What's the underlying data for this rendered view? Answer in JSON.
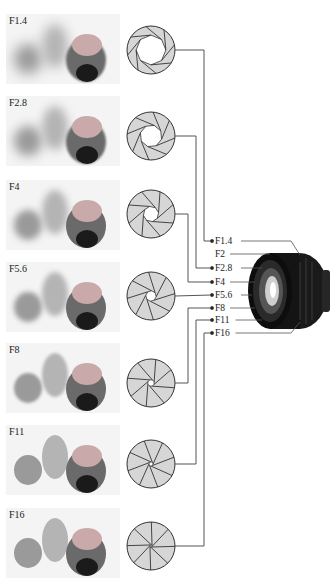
{
  "diagram": {
    "rows": [
      {
        "label": "F1.4",
        "aperture_ratio": 0.62,
        "blur": 5
      },
      {
        "label": "F2.8",
        "aperture_ratio": 0.46,
        "blur": 4
      },
      {
        "label": "F4",
        "aperture_ratio": 0.32,
        "blur": 3
      },
      {
        "label": "F5.6",
        "aperture_ratio": 0.22,
        "blur": 2
      },
      {
        "label": "F8",
        "aperture_ratio": 0.14,
        "blur": 1.2
      },
      {
        "label": "F11",
        "aperture_ratio": 0.09,
        "blur": 0.6
      },
      {
        "label": "F16",
        "aperture_ratio": 0.05,
        "blur": 0.2
      }
    ],
    "scale_labels": [
      "F1.4",
      "F2",
      "F2.8",
      "F4",
      "F5.6",
      "F8",
      "F11",
      "F16"
    ],
    "lens": "camera-lens",
    "colors": {
      "blade_fill": "#d6d6d6",
      "line": "#333333",
      "lens_body": "#111111"
    }
  }
}
